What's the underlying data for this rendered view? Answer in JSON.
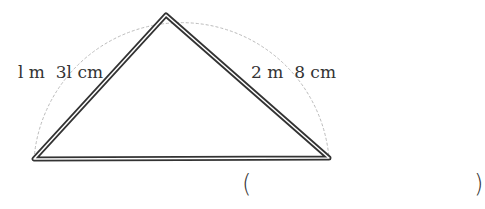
{
  "figure": {
    "shape": "triangle",
    "vertices": {
      "apex": [
        166,
        15
      ],
      "bottom_left": [
        34,
        159
      ],
      "bottom_right": [
        329,
        158
      ]
    },
    "circumscribed_arc": "dashed",
    "stroke_color": "#333333",
    "arc_color": "#bbbbbb"
  },
  "labels": {
    "left_side": "l m  3l cm",
    "right_side": "2 m  8 cm"
  },
  "answer": {
    "open_paren": "(",
    "close_paren": ")",
    "value": ""
  }
}
